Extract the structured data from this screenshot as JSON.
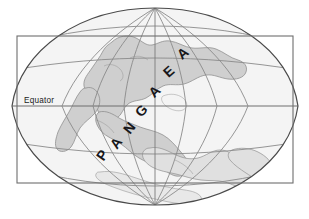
{
  "figure": {
    "kind": "paleogeographic map diagram",
    "projection": "elliptical (Mollweide-style) global projection",
    "background_color": "#ffffff"
  },
  "frame": {
    "name": "map-border-rectangle",
    "stroke_color": "#6e6e6e",
    "fill_color": "#ffffff",
    "x": 17,
    "y": 36,
    "width": 276,
    "height": 147
  },
  "globe": {
    "name": "globe-outline",
    "outline_color": "#4a4a4a",
    "ocean_color": "#f4f4f4",
    "pole_top_x": 155,
    "pole_top_y": 8,
    "pole_bottom_x": 155,
    "pole_bottom_y": 205,
    "left_x": 12,
    "right_x": 298,
    "equator_y": 106
  },
  "landmass": {
    "name": "pangaea-landmass",
    "label": "Pangaea",
    "fill_color": "#cfcfcf",
    "fill_color_south": "#e0e0e0",
    "stroke_color": "#8c8c8c"
  },
  "graticule": {
    "name": "latitude-longitude-grid",
    "line_color": "#8a8a8a",
    "parallels": [
      {
        "name": "parallel-north-high",
        "y": 36,
        "label": ""
      },
      {
        "name": "parallel-north-mid",
        "y": 67,
        "label": ""
      },
      {
        "name": "parallel-equator",
        "y": 106,
        "label": "Equator"
      },
      {
        "name": "parallel-south-mid",
        "y": 146,
        "label": ""
      },
      {
        "name": "parallel-south-high",
        "y": 178,
        "label": ""
      }
    ],
    "meridian_count": 7
  },
  "labels": {
    "equator": "Equator",
    "continent_name": "PANGAEA",
    "continent_letters": [
      {
        "char": "P",
        "x": 106,
        "y": 158,
        "rotate": -56
      },
      {
        "char": "A",
        "x": 120,
        "y": 146,
        "rotate": -54
      },
      {
        "char": "N",
        "x": 133,
        "y": 131,
        "rotate": -52
      },
      {
        "char": "G",
        "x": 145,
        "y": 114,
        "rotate": -48
      },
      {
        "char": "A",
        "x": 158,
        "y": 95,
        "rotate": -44
      },
      {
        "char": "E",
        "x": 172,
        "y": 75,
        "rotate": -42
      },
      {
        "char": "A",
        "x": 186,
        "y": 57,
        "rotate": -40
      }
    ]
  }
}
